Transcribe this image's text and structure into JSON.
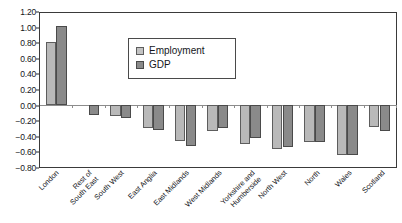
{
  "chart_data": {
    "type": "bar",
    "title": "",
    "subtitle": "",
    "xlabel": "",
    "ylabel": "",
    "ylim": [
      -0.8,
      1.2
    ],
    "ytick_step": 0.2,
    "grid": false,
    "legend_position": "inside-top-center",
    "categories": [
      "London",
      "Rest of South East",
      "South West",
      "East Anglia",
      "East Midlands",
      "West Midlands",
      "Yorkshire and Humberside",
      "North West",
      "North",
      "Wales",
      "Scotland"
    ],
    "category_lines": [
      [
        "London",
        ""
      ],
      [
        "Rest of",
        "South East"
      ],
      [
        "South West",
        ""
      ],
      [
        "East Anglia",
        ""
      ],
      [
        "East Midlands",
        ""
      ],
      [
        "West Midlands",
        ""
      ],
      [
        "Yorkshire and",
        "Humberside"
      ],
      [
        "North West",
        ""
      ],
      [
        "North",
        ""
      ],
      [
        "Wales",
        ""
      ],
      [
        "Scotland",
        ""
      ]
    ],
    "ytick_labels": [
      "1.20",
      "1.00",
      "0.80",
      "0.60",
      "0.40",
      "0.20",
      "0.00",
      "−0.20",
      "−0.40",
      "−0.60",
      "−0.80"
    ],
    "ytick_values": [
      1.2,
      1.0,
      0.8,
      0.6,
      0.4,
      0.2,
      0.0,
      -0.2,
      -0.4,
      -0.6,
      -0.8
    ],
    "series": [
      {
        "name": "Employment",
        "color": "#b9b9b9",
        "values": [
          0.82,
          0.0,
          -0.14,
          -0.3,
          -0.46,
          -0.33,
          -0.5,
          -0.56,
          -0.47,
          -0.64,
          -0.28
        ]
      },
      {
        "name": "GDP",
        "color": "#8a8a8a",
        "values": [
          1.03,
          -0.12,
          -0.17,
          -0.32,
          -0.53,
          -0.3,
          -0.42,
          -0.54,
          -0.47,
          -0.65,
          -0.33
        ]
      }
    ]
  },
  "legend": {
    "items": [
      {
        "label": "Employment",
        "swatch": "employment"
      },
      {
        "label": "GDP",
        "swatch": "gdp"
      }
    ]
  }
}
